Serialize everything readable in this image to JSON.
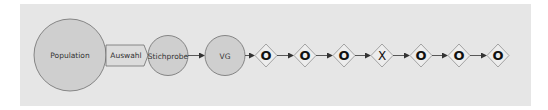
{
  "colors": {
    "background": "#ffffff",
    "panel": "#e6e6e6",
    "node_fill": "#cfcfcf",
    "node_stroke": "#6e6e6e",
    "arrow": "#333333",
    "gate_fill": "#ededed",
    "gate_stroke": "#9a9a9a",
    "gate_glyph": "#111111"
  },
  "nodes": {
    "population": {
      "label": "Population"
    },
    "auswahl": {
      "label": "Auswahl"
    },
    "stichprobe": {
      "label": "Stichprobe"
    },
    "vg": {
      "label": "VG"
    }
  },
  "gates": [
    {
      "symbol": "O"
    },
    {
      "symbol": "O"
    },
    {
      "symbol": "O"
    },
    {
      "symbol": "X"
    },
    {
      "symbol": "O"
    },
    {
      "symbol": "O"
    },
    {
      "symbol": "O"
    }
  ]
}
